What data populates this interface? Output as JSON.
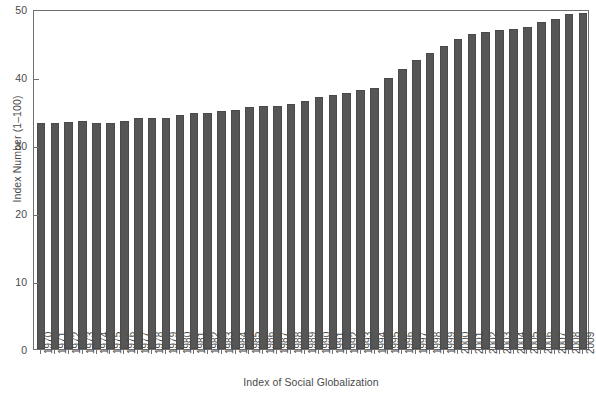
{
  "chart_data": {
    "type": "bar",
    "title": "",
    "subtitle": "",
    "xlabel": "Index of Social Globalization",
    "ylabel": "Index Number (1–100)",
    "ylim": [
      0,
      50
    ],
    "yticks": [
      0,
      10,
      20,
      30,
      40,
      50
    ],
    "ytick_labels": [
      "0",
      "10",
      "20",
      "30",
      "40",
      "50"
    ],
    "grid": false,
    "legend": null,
    "bar_color": "#565656",
    "frame_color": "#6f6f6f",
    "categories": [
      "1970",
      "1971",
      "1972",
      "1973",
      "1974",
      "1975",
      "1976",
      "1977",
      "1978",
      "1979",
      "1980",
      "1981",
      "1982",
      "1983",
      "1984",
      "1985",
      "1986",
      "1987",
      "1988",
      "1989",
      "1990",
      "1991",
      "1992",
      "1993",
      "1994",
      "1995",
      "1996",
      "1997",
      "1998",
      "1999",
      "2000",
      "2001",
      "2002",
      "2003",
      "2004",
      "2005",
      "2006",
      "2007",
      "2008",
      "2009"
    ],
    "values": [
      33.2,
      33.3,
      33.4,
      33.6,
      33.2,
      33.2,
      33.5,
      33.9,
      34.0,
      34.0,
      34.4,
      34.7,
      34.7,
      35.0,
      35.1,
      35.6,
      35.8,
      35.8,
      36.1,
      36.5,
      37.1,
      37.4,
      37.6,
      38.1,
      38.4,
      39.8,
      41.2,
      42.5,
      43.6,
      44.6,
      45.6,
      46.3,
      46.6,
      46.9,
      47.0,
      47.4,
      48.1,
      48.6,
      49.3,
      49.4
    ]
  }
}
